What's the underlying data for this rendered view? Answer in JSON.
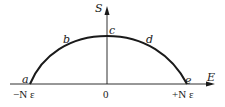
{
  "diagram": {
    "axes": {
      "x_label": "E",
      "y_label": "S"
    },
    "points": {
      "a": "a",
      "b": "b",
      "c": "c",
      "d": "d",
      "e": "e"
    },
    "ticks": {
      "left": "−N ε",
      "origin": "0",
      "right": "+N ε"
    },
    "colors": {
      "line": "#1a1a1a",
      "background": "#ffffff"
    }
  }
}
